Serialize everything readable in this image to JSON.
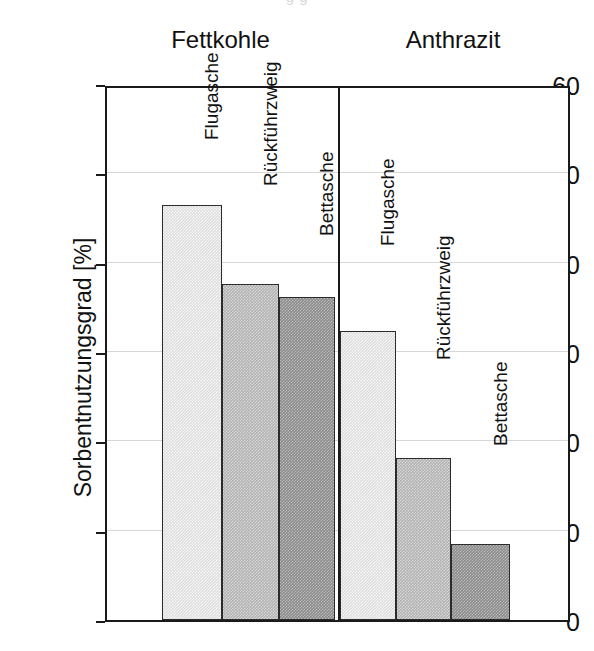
{
  "caption_remnant": "g g",
  "axis": {
    "y_title": "Sorbentnutzungsgrad [%]",
    "y_ticks": [
      "0",
      "10",
      "20",
      "30",
      "40",
      "50",
      "60"
    ]
  },
  "groups": [
    {
      "label": "Fettkohle"
    },
    {
      "label": "Anthrazit"
    }
  ],
  "bar_labels": [
    "Flugasche",
    "Rückführzweig",
    "Bettasche",
    "Flugasche",
    "Rückführzweig",
    "Bettasche"
  ],
  "colors": {
    "light": "#dcdcdc",
    "medium": "#b0b0b0",
    "dark": "#8a8a8a",
    "outline": "#2b2b2b",
    "grid": "#d7d7d7",
    "frame": "#1a1a1a"
  },
  "chart_data": {
    "type": "bar",
    "title": "",
    "xlabel": "",
    "ylabel": "Sorbentnutzungsgrad [%]",
    "ylim": [
      0,
      60
    ],
    "yticks": [
      0,
      10,
      20,
      30,
      40,
      50,
      60
    ],
    "grid": true,
    "legend_position": "none",
    "group_labels": [
      "Fettkohle",
      "Anthrazit"
    ],
    "categories": [
      "Flugasche",
      "Rückführzweig",
      "Bettasche"
    ],
    "series": [
      {
        "name": "Fettkohle",
        "values": [
          46.5,
          37.6,
          36.2
        ]
      },
      {
        "name": "Anthrazit",
        "values": [
          32.3,
          18.1,
          8.5
        ]
      }
    ],
    "bars": [
      {
        "group": "Fettkohle",
        "category": "Flugasche",
        "value": 46.5,
        "fill": "light"
      },
      {
        "group": "Fettkohle",
        "category": "Rückführzweig",
        "value": 37.6,
        "fill": "medium"
      },
      {
        "group": "Fettkohle",
        "category": "Bettasche",
        "value": 36.2,
        "fill": "dark"
      },
      {
        "group": "Anthrazit",
        "category": "Flugasche",
        "value": 32.3,
        "fill": "light"
      },
      {
        "group": "Anthrazit",
        "category": "Rückführzweig",
        "value": 18.1,
        "fill": "medium"
      },
      {
        "group": "Anthrazit",
        "category": "Bettasche",
        "value": 8.5,
        "fill": "dark"
      }
    ]
  },
  "layout": {
    "plot": {
      "left": 105,
      "top": 86,
      "width": 465,
      "height": 536
    },
    "group_divider_x": 231,
    "bar_geometry": [
      {
        "x": 55,
        "w": 60,
        "label_top": 52
      },
      {
        "x": 115,
        "w": 57,
        "label_top": 98
      },
      {
        "x": 172,
        "w": 56,
        "label_top": 148
      },
      {
        "x": 233,
        "w": 56,
        "label_top": 158
      },
      {
        "x": 289,
        "w": 55,
        "label_top": 272
      },
      {
        "x": 344,
        "w": 59,
        "label_top": 358
      }
    ]
  }
}
